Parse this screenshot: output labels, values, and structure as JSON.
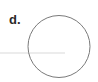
{
  "figure": {
    "label": "d.",
    "shapes": {
      "circle": {
        "cx": 59,
        "cy": 46.5,
        "r": 31,
        "stroke": "#7a7a7a",
        "fill": "none"
      },
      "line": {
        "x1": 0,
        "y1": 53,
        "x2": 65,
        "y2": 53,
        "stroke": "#e6e6e6"
      }
    }
  }
}
